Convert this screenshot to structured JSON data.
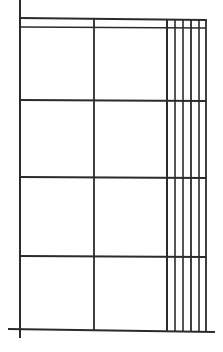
{
  "document": {
    "title": "Grid Frame Elevation Line Drawing",
    "kind": "technical-line-drawing",
    "background_color": "#ffffff",
    "stroke_color": "#2b2b2b",
    "canvas": {
      "width": 223,
      "height": 352
    }
  },
  "diagram": {
    "stroke_color": "#2b2b2b",
    "stroke_color_light": "#555555",
    "lines": [
      {
        "name": "left-post",
        "type": "vertical",
        "x1": 20,
        "y1": 0,
        "x2": 20,
        "y2": 338,
        "width": 2.0,
        "color": "#2b2b2b"
      },
      {
        "name": "top-rail-upper",
        "type": "horizontal",
        "x1": 20,
        "y1": 18,
        "x2": 206,
        "y2": 20,
        "width": 1.8,
        "color": "#2b2b2b"
      },
      {
        "name": "top-rail-lower",
        "type": "horizontal",
        "x1": 20,
        "y1": 27,
        "x2": 206,
        "y2": 28,
        "width": 1.6,
        "color": "#2b2b2b"
      },
      {
        "name": "mid-rail-1",
        "type": "horizontal",
        "x1": 20,
        "y1": 100,
        "x2": 206,
        "y2": 101,
        "width": 1.8,
        "color": "#2b2b2b"
      },
      {
        "name": "mid-rail-2",
        "type": "horizontal",
        "x1": 20,
        "y1": 177,
        "x2": 206,
        "y2": 178,
        "width": 1.8,
        "color": "#2b2b2b"
      },
      {
        "name": "mid-rail-3",
        "type": "horizontal",
        "x1": 20,
        "y1": 256,
        "x2": 206,
        "y2": 257,
        "width": 1.8,
        "color": "#2b2b2b"
      },
      {
        "name": "base-rail",
        "type": "horizontal",
        "x1": 8,
        "y1": 329,
        "x2": 215,
        "y2": 332,
        "width": 2.0,
        "color": "#2b2b2b"
      },
      {
        "name": "center-mullion",
        "type": "vertical",
        "x1": 94,
        "y1": 18,
        "x2": 94,
        "y2": 330,
        "width": 1.8,
        "color": "#2b2b2b"
      },
      {
        "name": "right-bar-1",
        "type": "vertical",
        "x1": 167,
        "y1": 19,
        "x2": 167,
        "y2": 331,
        "width": 2.0,
        "color": "#2b2b2b"
      },
      {
        "name": "right-bar-2",
        "type": "vertical",
        "x1": 175,
        "y1": 19,
        "x2": 175,
        "y2": 331,
        "width": 1.6,
        "color": "#2b2b2b"
      },
      {
        "name": "right-bar-3",
        "type": "vertical",
        "x1": 183,
        "y1": 19,
        "x2": 183,
        "y2": 331,
        "width": 1.6,
        "color": "#2b2b2b"
      },
      {
        "name": "right-bar-4",
        "type": "vertical",
        "x1": 191,
        "y1": 19,
        "x2": 191,
        "y2": 331,
        "width": 1.8,
        "color": "#2b2b2b"
      },
      {
        "name": "right-bar-5",
        "type": "vertical",
        "x1": 199,
        "y1": 19,
        "x2": 199,
        "y2": 331,
        "width": 1.6,
        "color": "#2b2b2b"
      },
      {
        "name": "right-post",
        "type": "vertical",
        "x1": 206,
        "y1": 19,
        "x2": 206,
        "y2": 331,
        "width": 1.8,
        "color": "#2b2b2b"
      }
    ],
    "panels": {
      "rows": 4,
      "columns": 2,
      "right_bar_count": 5
    }
  }
}
